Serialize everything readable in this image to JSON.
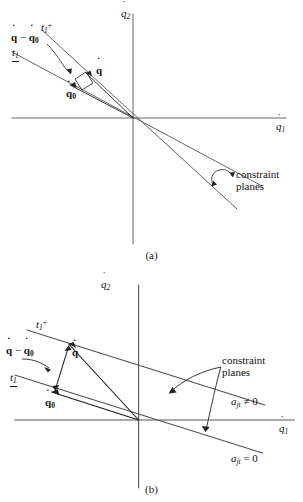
{
  "figure": {
    "background_color": "#ffffff",
    "line_color": "#444444",
    "text_color": "#111111"
  },
  "captions": {
    "panel_a": "(a)",
    "panel_b": "(b)"
  },
  "axes": {
    "x_label_base": "q",
    "x_label_sub": "1",
    "y_label_base": "q",
    "y_label_sub": "2",
    "x_label_full": "q̇₁",
    "y_label_full": "q̇₂",
    "dot_accent": "˙"
  },
  "panel_a": {
    "name": "(a)",
    "origin": {
      "x": 133,
      "y": 118
    },
    "labels": {
      "t1_plus": {
        "base": "t",
        "sub": "1",
        "sup": "+",
        "text": "t₁+"
      },
      "t1_minus": {
        "base": "t",
        "sub": "1",
        "overbar": true,
        "text": "t₁⁻"
      },
      "qdot_diff": {
        "text": "q̇ − q̇₀"
      },
      "qdot": {
        "text": "q̇"
      },
      "qdot_zero": {
        "text": "q̇₀"
      },
      "constraint_planes": {
        "line1": "constraint",
        "line2": "planes"
      }
    },
    "description": "Two constraint planes intersecting at the origin; velocity vectors q̇ and q̇₀ with a right-angle marker showing orthogonality of q̇ − q̇₀ to the t₁⁺ plane."
  },
  "panel_b": {
    "name": "(b)",
    "origin": {
      "x": 138,
      "y": 420
    },
    "labels": {
      "t1_plus": {
        "base": "t",
        "sub": "1",
        "sup": "+",
        "text": "t₁+"
      },
      "t1_minus": {
        "base": "t",
        "sub": "1",
        "overbar": true,
        "text": "t₁⁻"
      },
      "qdot_diff": {
        "text": "q̇ − q̇₀"
      },
      "qdot": {
        "text": "q̇"
      },
      "qdot_zero": {
        "text": "q̇₀"
      },
      "constraint_planes": {
        "line1": "constraint",
        "line2": "planes"
      },
      "a_jt_nonzero": {
        "symbol": "a",
        "sub": "jt",
        "relation": "≠",
        "value": "0",
        "text": "a_jt ≠ 0"
      },
      "a_jt_zero": {
        "symbol": "a",
        "sub": "jt",
        "relation": "=",
        "value": "0",
        "text": "a_jt = 0"
      }
    },
    "description": "Two parallel offset constraint planes: the upper (a_jt ≠ 0) does not pass through the origin, the lower (a_jt = 0) passes through the origin."
  }
}
